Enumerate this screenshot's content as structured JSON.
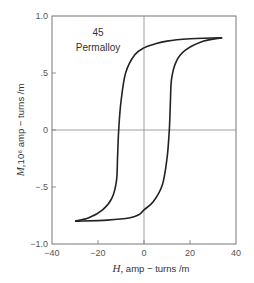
{
  "chart_data": {
    "type": "line",
    "title": "",
    "annotations": [
      "45",
      "Permalloy"
    ],
    "xlabel": "H, amp − turns /m",
    "ylabel": "M,10⁶ amp − turns /m",
    "xlim": [
      -40,
      40
    ],
    "ylim": [
      -1.0,
      1.0
    ],
    "x_ticks": [
      -40,
      -20,
      0,
      20,
      40
    ],
    "x_tick_labels": [
      "−40",
      "−20",
      "0",
      "20",
      "40"
    ],
    "y_ticks": [
      1.0,
      0.5,
      0,
      -0.5,
      -1.0
    ],
    "y_tick_labels": [
      "1.0",
      ".5",
      "0",
      "−.5",
      "−1.0"
    ],
    "grid": false,
    "zero_lines": true,
    "legend": null,
    "series": [
      {
        "name": "Hysteresis loop (descending branch)",
        "x": [
          34,
          20,
          10,
          4,
          0,
          -4,
          -8,
          -10,
          -11,
          -11.5,
          -12,
          -14,
          -18,
          -24,
          -30
        ],
        "y": [
          0.81,
          0.8,
          0.78,
          0.75,
          0.72,
          0.66,
          0.5,
          0.25,
          0.0,
          -0.25,
          -0.45,
          -0.6,
          -0.7,
          -0.77,
          -0.8
        ]
      },
      {
        "name": "Hysteresis loop (ascending branch)",
        "x": [
          -30,
          -16,
          -6,
          -2,
          0,
          4,
          8,
          10,
          11,
          11.5,
          12,
          14,
          18,
          26,
          34
        ],
        "y": [
          -0.8,
          -0.79,
          -0.77,
          -0.74,
          -0.7,
          -0.63,
          -0.48,
          -0.25,
          0.0,
          0.25,
          0.45,
          0.6,
          0.7,
          0.78,
          0.81
        ]
      }
    ],
    "key_values": {
      "saturation_tip_positive": [
        34,
        0.81
      ],
      "saturation_tip_negative": [
        -30,
        -0.8
      ],
      "remanence": 0.71,
      "coercivity": 11
    }
  },
  "labels": {
    "annotation_number": "45",
    "annotation_material": "Permalloy",
    "x_axis_title_symbol": "H,",
    "x_axis_title_rest": " amp − turns /m",
    "y_axis_title_symbol": "M,",
    "y_axis_title_rest": "10⁶ amp − turns /m"
  },
  "colors": {
    "curve": "#222222",
    "frame": "#777777",
    "zero_line": "#888888",
    "text": "#444444"
  }
}
